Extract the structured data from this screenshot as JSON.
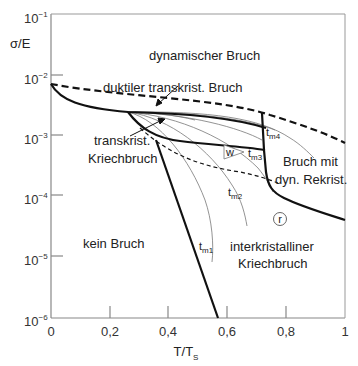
{
  "diagram": {
    "y_axis": {
      "label": "σ/E",
      "scale": "log",
      "ticks": [
        {
          "base": "10",
          "exp": "−1"
        },
        {
          "base": "10",
          "exp": "−2"
        },
        {
          "base": "10",
          "exp": "−3"
        },
        {
          "base": "10",
          "exp": "−4"
        },
        {
          "base": "10",
          "exp": "−5"
        },
        {
          "base": "10",
          "exp": "−6"
        }
      ]
    },
    "x_axis": {
      "label_main": "T/T",
      "label_sub": "S",
      "ticks": [
        "0",
        "0,2",
        "0,4",
        "0,6",
        "0,8",
        "1"
      ]
    },
    "regions": {
      "dynamic": "dynamischer Bruch",
      "ductile": "duktiler transkrist. Bruch",
      "transcreep_line1": "transkrist.",
      "transcreep_line2": "Kriechbruch",
      "dynrex_line1": "Bruch mit",
      "dynrex_line2": "dyn. Rekrist.",
      "none": "kein Bruch",
      "intercreep_line1": "interkristalliner",
      "intercreep_line2": "Kriechbruch"
    },
    "markers": {
      "w": "w",
      "r": "r"
    },
    "time_labels": [
      {
        "main": "t",
        "sub": "m1"
      },
      {
        "main": "t",
        "sub": "m2"
      },
      {
        "main": "t",
        "sub": "m3"
      },
      {
        "main": "t",
        "sub": "m4"
      }
    ],
    "colors": {
      "axis": "#888888",
      "boundary": "#111111",
      "contour": "#777777",
      "text": "#222222"
    }
  }
}
